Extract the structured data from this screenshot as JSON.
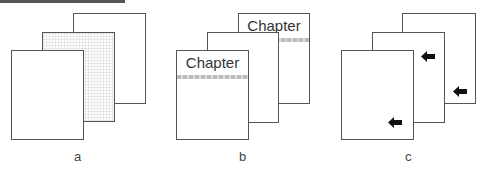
{
  "figure": {
    "panels": [
      {
        "label": "a",
        "description": "stacked pages, middle page shaded"
      },
      {
        "label": "b",
        "header_text": "Chapter",
        "header_text_2": "Chapter"
      },
      {
        "label": "c",
        "marker_icon": "arrow-left-icon"
      }
    ]
  }
}
